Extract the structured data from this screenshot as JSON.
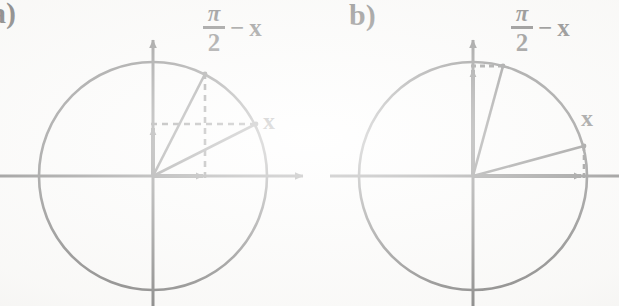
{
  "figure": {
    "background_color": "#fbfbfa",
    "ink_color": "#131313"
  },
  "panels": [
    {
      "tag": "a)",
      "name": "panel-a",
      "circle": {
        "cx": 153,
        "cy": 176,
        "r": 114
      },
      "axes": {
        "x_axis": {
          "x1": 0,
          "y1": 176,
          "x2": 305,
          "y2": 176,
          "arrow": "right"
        },
        "y_axis": {
          "x1": 153,
          "y1": 306,
          "x2": 153,
          "y2": 36,
          "arrow": "up"
        }
      },
      "angle_label": {
        "numerator": "π",
        "denominator": "2",
        "operator": "−",
        "variable": "x"
      },
      "point_label": "x",
      "radii": [
        {
          "name": "radius-pi-over-2-minus-x",
          "angle_deg": 63,
          "terminal": {
            "x": 205,
            "y": 74
          }
        },
        {
          "name": "radius-x",
          "angle_deg": 27,
          "terminal": {
            "x": 255,
            "y": 124
          }
        }
      ],
      "component_arrows": [
        {
          "name": "sine-arrow-vertical",
          "from": {
            "x": 153,
            "y": 176
          },
          "to": {
            "x": 153,
            "y": 124
          }
        },
        {
          "name": "cosine-arrow-horizontal",
          "from": {
            "x": 153,
            "y": 176
          },
          "to": {
            "x": 205,
            "y": 176
          }
        }
      ],
      "dashed_lines": [
        {
          "name": "dashed-horizontal-to-x-point",
          "from": {
            "x": 153,
            "y": 124
          },
          "to": {
            "x": 255,
            "y": 124
          }
        },
        {
          "name": "dashed-vertical-to-complement-point",
          "from": {
            "x": 205,
            "y": 176
          },
          "to": {
            "x": 205,
            "y": 74
          }
        }
      ]
    },
    {
      "tag": "b)",
      "name": "panel-b",
      "circle": {
        "cx": 473,
        "cy": 176,
        "r": 114
      },
      "axes": {
        "x_axis": {
          "x1": 330,
          "y1": 176,
          "x2": 619,
          "y2": 176,
          "arrow": "right"
        },
        "y_axis": {
          "x1": 473,
          "y1": 306,
          "x2": 473,
          "y2": 36,
          "arrow": "up"
        }
      },
      "angle_label": {
        "numerator": "π",
        "denominator": "2",
        "operator": "−",
        "variable": "x"
      },
      "point_label": "x",
      "radii": [
        {
          "name": "radius-pi-over-2-minus-x",
          "angle_deg": 75,
          "terminal": {
            "x": 503,
            "y": 66
          }
        },
        {
          "name": "radius-x",
          "angle_deg": 15,
          "terminal": {
            "x": 583,
            "y": 146
          }
        }
      ],
      "component_arrows": [
        {
          "name": "sine-arrow-vertical",
          "from": {
            "x": 473,
            "y": 176
          },
          "to": {
            "x": 473,
            "y": 66
          }
        },
        {
          "name": "cosine-arrow-horizontal",
          "from": {
            "x": 473,
            "y": 176
          },
          "to": {
            "x": 583,
            "y": 176
          }
        }
      ],
      "dashed_lines": [
        {
          "name": "dashed-horizontal-to-complement-point",
          "from": {
            "x": 473,
            "y": 66
          },
          "to": {
            "x": 503,
            "y": 66
          }
        },
        {
          "name": "dashed-vertical-to-x-point",
          "from": {
            "x": 583,
            "y": 176
          },
          "to": {
            "x": 583,
            "y": 146
          }
        }
      ]
    }
  ]
}
